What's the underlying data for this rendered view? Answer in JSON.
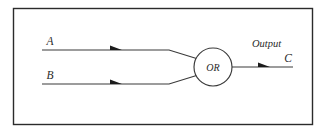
{
  "diagram": {
    "frame": {
      "name": "outer-border",
      "x": 13,
      "y": 8,
      "width": 300,
      "height": 117,
      "stroke_color": "#2b2b2b",
      "fill_color": "#ffffff"
    },
    "gate": {
      "label": "OR",
      "shape": "circle",
      "cx": 213,
      "cy": 67,
      "r": 19,
      "stroke_color": "#3a3a3a",
      "fill_color": "#ffffff"
    },
    "inputs": [
      {
        "label": "A",
        "label_x": 50,
        "label_y": 45,
        "line_x1": 42,
        "line_y": 50,
        "line_x2": 168,
        "arrow_x": 120,
        "name": "input-a"
      },
      {
        "label": "B",
        "label_x": 50,
        "label_y": 79,
        "line_x1": 42,
        "line_y": 84,
        "line_x2": 168,
        "arrow_x": 120,
        "name": "input-b"
      }
    ],
    "output": {
      "label": "C",
      "caption": "Output",
      "caption_x": 252,
      "caption_y": 47,
      "label_x": 287,
      "label_y": 62,
      "line_x1": 232,
      "line_y": 67,
      "line_x2": 293,
      "arrow_x": 268,
      "name": "output-c"
    },
    "colors": {
      "background": "#ffffff",
      "wire": "#3a3a3a",
      "border": "#2b2b2b",
      "text": "#2b2b2b",
      "arrow": "#1c1c1c"
    }
  }
}
